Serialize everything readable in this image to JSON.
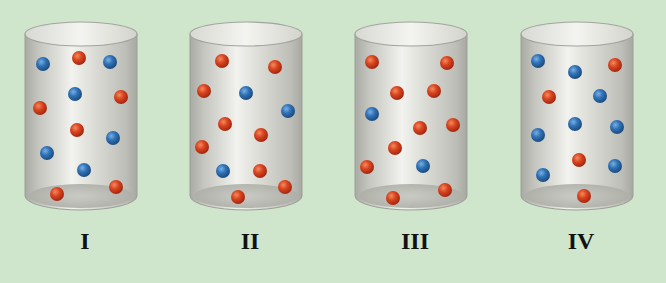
{
  "background": "#cfe6cd",
  "colors": {
    "red_particle": "#d2411f",
    "blue_particle": "#2e6fb3"
  },
  "cylinders": [
    {
      "label": "I",
      "offset_x": 0,
      "particles": [
        {
          "x": 43,
          "y": 64,
          "c": "blue"
        },
        {
          "x": 79,
          "y": 58,
          "c": "red"
        },
        {
          "x": 110,
          "y": 62,
          "c": "blue"
        },
        {
          "x": 75,
          "y": 94,
          "c": "blue"
        },
        {
          "x": 121,
          "y": 97,
          "c": "red"
        },
        {
          "x": 40,
          "y": 108,
          "c": "red"
        },
        {
          "x": 77,
          "y": 130,
          "c": "red"
        },
        {
          "x": 113,
          "y": 138,
          "c": "blue"
        },
        {
          "x": 47,
          "y": 153,
          "c": "blue"
        },
        {
          "x": 84,
          "y": 170,
          "c": "blue"
        },
        {
          "x": 116,
          "y": 187,
          "c": "red"
        },
        {
          "x": 57,
          "y": 194,
          "c": "red"
        }
      ]
    },
    {
      "label": "II",
      "offset_x": 165,
      "particles": [
        {
          "x": 222,
          "y": 61,
          "c": "red"
        },
        {
          "x": 275,
          "y": 67,
          "c": "red"
        },
        {
          "x": 204,
          "y": 91,
          "c": "red"
        },
        {
          "x": 246,
          "y": 93,
          "c": "blue"
        },
        {
          "x": 288,
          "y": 111,
          "c": "blue"
        },
        {
          "x": 225,
          "y": 124,
          "c": "red"
        },
        {
          "x": 261,
          "y": 135,
          "c": "red"
        },
        {
          "x": 202,
          "y": 147,
          "c": "red"
        },
        {
          "x": 223,
          "y": 171,
          "c": "blue"
        },
        {
          "x": 260,
          "y": 171,
          "c": "red"
        },
        {
          "x": 285,
          "y": 187,
          "c": "red"
        },
        {
          "x": 238,
          "y": 197,
          "c": "red"
        }
      ]
    },
    {
      "label": "III",
      "offset_x": 330,
      "particles": [
        {
          "x": 372,
          "y": 62,
          "c": "red"
        },
        {
          "x": 447,
          "y": 63,
          "c": "red"
        },
        {
          "x": 397,
          "y": 93,
          "c": "red"
        },
        {
          "x": 434,
          "y": 91,
          "c": "red"
        },
        {
          "x": 372,
          "y": 114,
          "c": "blue"
        },
        {
          "x": 420,
          "y": 128,
          "c": "red"
        },
        {
          "x": 453,
          "y": 125,
          "c": "red"
        },
        {
          "x": 395,
          "y": 148,
          "c": "red"
        },
        {
          "x": 367,
          "y": 167,
          "c": "red"
        },
        {
          "x": 423,
          "y": 166,
          "c": "blue"
        },
        {
          "x": 445,
          "y": 190,
          "c": "red"
        },
        {
          "x": 393,
          "y": 198,
          "c": "red"
        }
      ]
    },
    {
      "label": "IV",
      "offset_x": 496,
      "particles": [
        {
          "x": 538,
          "y": 61,
          "c": "blue"
        },
        {
          "x": 575,
          "y": 72,
          "c": "blue"
        },
        {
          "x": 615,
          "y": 65,
          "c": "red"
        },
        {
          "x": 549,
          "y": 97,
          "c": "red"
        },
        {
          "x": 600,
          "y": 96,
          "c": "blue"
        },
        {
          "x": 575,
          "y": 124,
          "c": "blue"
        },
        {
          "x": 617,
          "y": 127,
          "c": "blue"
        },
        {
          "x": 538,
          "y": 135,
          "c": "blue"
        },
        {
          "x": 579,
          "y": 160,
          "c": "red"
        },
        {
          "x": 615,
          "y": 166,
          "c": "blue"
        },
        {
          "x": 543,
          "y": 175,
          "c": "blue"
        },
        {
          "x": 584,
          "y": 196,
          "c": "red"
        }
      ]
    }
  ]
}
